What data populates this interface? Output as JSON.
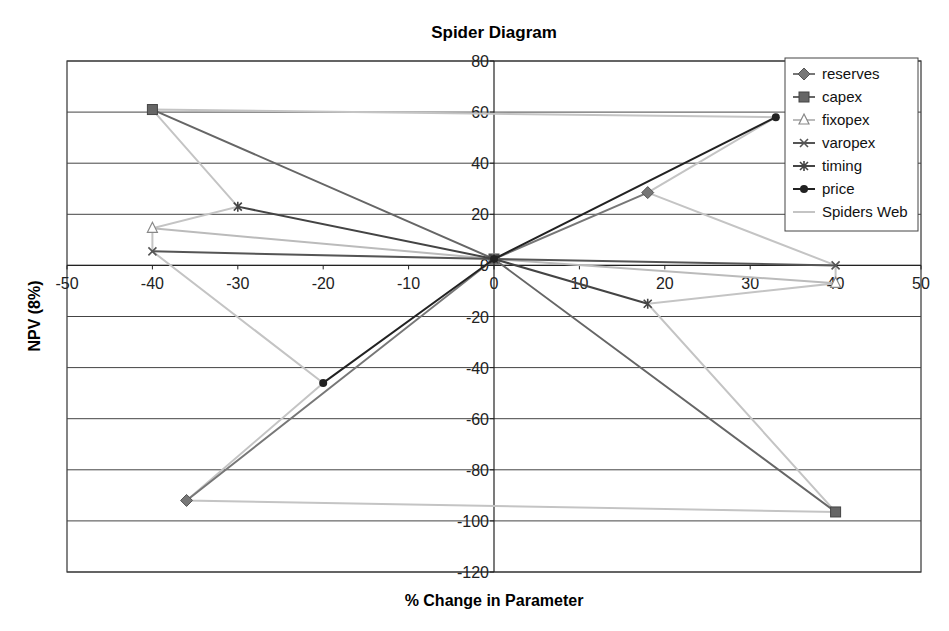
{
  "chart_data": {
    "type": "line",
    "title": "Spider Diagram",
    "xlabel": "% Change in Parameter",
    "ylabel": "NPV (8%)",
    "xlim": [
      -50,
      50
    ],
    "ylim": [
      -120,
      80
    ],
    "x_ticks": [
      -50,
      -40,
      -30,
      -20,
      -10,
      0,
      10,
      20,
      30,
      40,
      50
    ],
    "y_ticks": [
      80,
      60,
      40,
      20,
      0,
      -20,
      -40,
      -60,
      -80,
      -100,
      -120
    ],
    "grid": {
      "horizontal": true,
      "vertical": false
    },
    "legend_position": "top-right inside",
    "series": [
      {
        "name": "reserves",
        "marker": "diamond",
        "color": "#777777",
        "points": [
          [
            -36,
            -92
          ],
          [
            0,
            2.5
          ],
          [
            18,
            28.5
          ]
        ]
      },
      {
        "name": "capex",
        "marker": "square",
        "color": "#666666",
        "points": [
          [
            -40,
            61
          ],
          [
            0,
            2.5
          ],
          [
            40,
            -96.5
          ]
        ]
      },
      {
        "name": "fixopex",
        "marker": "triangle",
        "color": "#bbbbbb",
        "points": [
          [
            -40,
            14.5
          ],
          [
            0,
            2.5
          ],
          [
            40,
            -7
          ]
        ]
      },
      {
        "name": "varopex",
        "marker": "x",
        "color": "#555555",
        "points": [
          [
            -40,
            5.5
          ],
          [
            0,
            2.5
          ],
          [
            40,
            0
          ]
        ]
      },
      {
        "name": "timing",
        "marker": "star",
        "color": "#444444",
        "points": [
          [
            -30,
            23
          ],
          [
            0,
            2.5
          ],
          [
            18,
            -15
          ]
        ]
      },
      {
        "name": "price",
        "marker": "circle",
        "color": "#222222",
        "points": [
          [
            -20,
            -46
          ],
          [
            0,
            2.5
          ],
          [
            33,
            58
          ]
        ]
      },
      {
        "name": "Spiders Web",
        "marker": "none",
        "color": "#c4c4c4",
        "points": [
          [
            -40,
            61
          ],
          [
            33,
            58
          ],
          [
            18,
            28.5
          ],
          [
            40,
            0
          ],
          [
            40,
            -7
          ],
          [
            18,
            -15
          ],
          [
            40,
            -96.5
          ],
          [
            -36,
            -92
          ],
          [
            -20,
            -46
          ],
          [
            -40,
            5.5
          ],
          [
            -40,
            14.5
          ],
          [
            -30,
            23
          ],
          [
            -40,
            61
          ]
        ]
      }
    ]
  },
  "legend": {
    "items": [
      "reserves",
      "capex",
      "fixopex",
      "varopex",
      "timing",
      "price",
      "Spiders Web"
    ]
  }
}
